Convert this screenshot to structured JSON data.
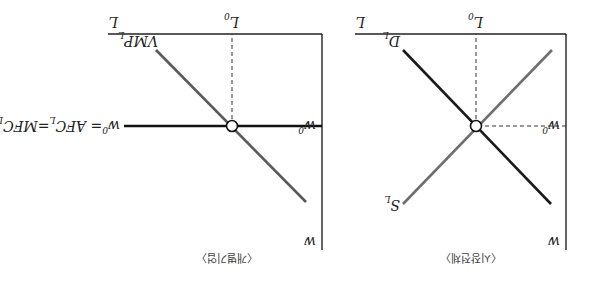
{
  "figure": {
    "orientation": "rotated-180",
    "colors": {
      "axis": "#222222",
      "demand": "#1a1a1a",
      "supply": "#6e6e6e",
      "vmp": "#5a5a5a",
      "wage_line": "#111111",
      "dashed": "#333333",
      "background": "#ffffff"
    }
  },
  "panels": [
    {
      "id": "labor-market",
      "caption": "〈시장전체〉",
      "x_axis_label": "L",
      "y_axis_label": "w",
      "equilibrium_quantity_label": "L",
      "equilibrium_quantity_sub": "0",
      "equilibrium_wage_label": "w",
      "equilibrium_wage_sub": "0",
      "curves": [
        {
          "name": "D",
          "sub": "L",
          "type": "demand"
        },
        {
          "name": "S",
          "sub": "L",
          "type": "supply"
        }
      ]
    },
    {
      "id": "individual-firm",
      "caption": "〈개별기업〉",
      "x_axis_label": "L",
      "y_axis_label": "w",
      "equilibrium_quantity_label": "L",
      "equilibrium_quantity_sub": "0",
      "equilibrium_wage_label": "w",
      "equilibrium_wage_sub": "0",
      "curves": [
        {
          "name": "VMP",
          "sub": "L",
          "type": "vmp"
        }
      ],
      "wage_line_label": {
        "w": "w",
        "w_sub": "0",
        "eq1": "= AFC",
        "afc_sub": "L",
        "eq2": "=MFC",
        "mfc_sub": "L"
      }
    }
  ]
}
